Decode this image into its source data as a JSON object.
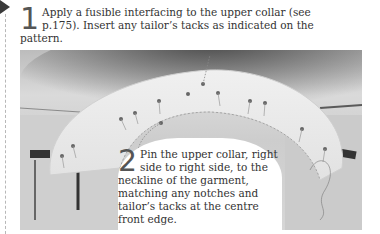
{
  "steps": [
    {
      "number": "1",
      "text": "Apply a fusible interfacing to the upper collar (see p.175). Insert any tailor’s tacks as indicated on the pattern."
    },
    {
      "number": "2",
      "text": "Pin the upper collar, right side to right side, to the neckline of the garment, matching any notches and tailor’s tacks at the centre front edge."
    }
  ],
  "photo": {
    "subject": "upper collar pinned to garment neckline with pins and tailor's tacks"
  },
  "colors": {
    "text": "#333333",
    "number": "#555555",
    "pointer": "#3a3a3a",
    "rule": "#b8b8b8"
  }
}
